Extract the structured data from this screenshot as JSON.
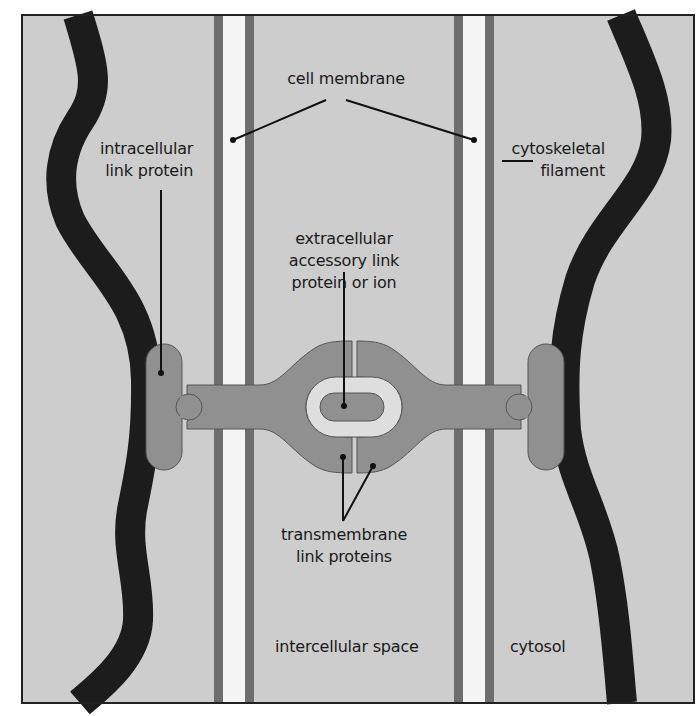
{
  "figure": {
    "type": "diagram",
    "colors": {
      "background": "#cdcdcd",
      "frame": "#222222",
      "membrane_dark": "#6e6e6e",
      "membrane_light": "#f4f4f4",
      "filament": "#1c1c1c",
      "protein": "#909090",
      "protein_outline": "#555555",
      "ring": "#dedede",
      "leader": "#111111"
    }
  },
  "labels": {
    "cell_membrane": "cell membrane",
    "intracellular_link_protein": [
      "intracellular",
      "link protein"
    ],
    "cytoskeletal_filament": [
      "cytoskeletal",
      "filament"
    ],
    "extracellular_accessory": [
      "extracellular",
      "accessory link",
      "protein or ion"
    ],
    "transmembrane_link_proteins": [
      "transmembrane",
      "link proteins"
    ],
    "intercellular_space": "intercellular space",
    "cytosol": "cytosol"
  }
}
